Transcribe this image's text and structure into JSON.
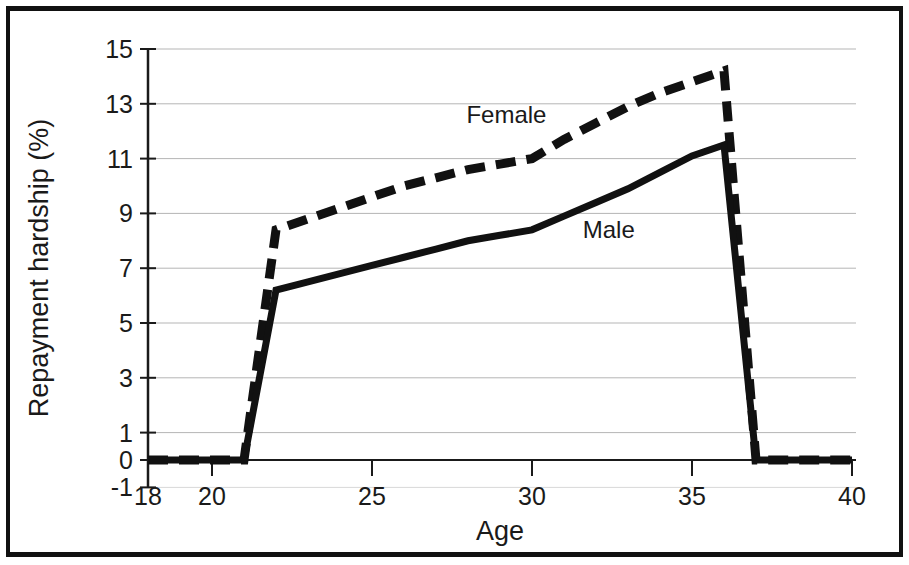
{
  "chart_data": {
    "type": "line",
    "title": "",
    "xlabel": "Age",
    "ylabel": "Repayment hardship (%)",
    "xlim": [
      18,
      40
    ],
    "ylim": [
      -1,
      15
    ],
    "xticks": [
      18,
      20,
      25,
      30,
      35,
      40
    ],
    "yticks": [
      -1,
      0,
      1,
      3,
      5,
      7,
      9,
      11,
      13,
      15
    ],
    "grid": "horizontal",
    "legend_position": "inline-annotations",
    "x": [
      18,
      19,
      20,
      21,
      22,
      23,
      24,
      25,
      26,
      27,
      28,
      29,
      30,
      31,
      32,
      33,
      34,
      35,
      36,
      37,
      38,
      39,
      40
    ],
    "series": [
      {
        "name": "Female",
        "style": "dashed",
        "color": "#111111",
        "label_x": 29.2,
        "label_y": 12.3,
        "values": [
          0,
          0,
          0,
          0,
          8.4,
          8.8,
          9.2,
          9.6,
          10.0,
          10.3,
          10.6,
          10.8,
          11.0,
          11.7,
          12.3,
          12.9,
          13.4,
          13.8,
          14.2,
          0,
          0,
          0,
          0
        ]
      },
      {
        "name": "Male",
        "style": "solid",
        "color": "#111111",
        "label_x": 32.4,
        "label_y": 8.1,
        "values": [
          0,
          0,
          0,
          0,
          6.2,
          6.5,
          6.8,
          7.1,
          7.4,
          7.7,
          8.0,
          8.2,
          8.4,
          8.9,
          9.4,
          9.9,
          10.5,
          11.1,
          11.5,
          0,
          0,
          0,
          0
        ]
      }
    ],
    "annotations": [
      {
        "text": "Female"
      },
      {
        "text": "Male"
      }
    ]
  },
  "axis": {
    "y_title": "Repayment hardship (%)",
    "x_title": "Age",
    "y_tick_labels": [
      "15",
      "13",
      "11",
      "9",
      "7",
      "5",
      "3",
      "1",
      "0",
      "-1"
    ],
    "x_tick_labels": [
      "18",
      "20",
      "25",
      "30",
      "35",
      "40"
    ]
  },
  "labels": {
    "female": "Female",
    "male": "Male"
  }
}
